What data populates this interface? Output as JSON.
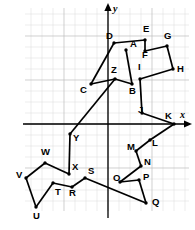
{
  "figure": {
    "background_color": "#ffffff",
    "stroke_color": "#000000",
    "grid_minor_color": "#d9d9d9",
    "grid_major_color": "#bcbcbc"
  },
  "axes": {
    "x_label": "x",
    "y_label": "y",
    "origin_px": {
      "x": 108,
      "y": 124
    },
    "cell_px": 11,
    "x_axis_y_px": 124,
    "y_axis_x_px": 108,
    "grid_left_px": 25,
    "grid_right_px": 189,
    "grid_top_px": 8,
    "grid_bottom_px": 211,
    "x_arrow": true,
    "y_arrow": true
  },
  "chart_data": {
    "type": "scatter",
    "xlabel": "x",
    "ylabel": "y",
    "grid": true,
    "legend": "none",
    "xlim": [
      -7.5,
      7.4
    ],
    "ylim": [
      -7.9,
      10.5
    ],
    "points": [
      {
        "label": "A",
        "px": [
          126,
          50
        ],
        "grid": [
          1.6,
          6.7
        ],
        "label_px": [
          130,
          47
        ]
      },
      {
        "label": "B",
        "px": [
          132,
          84
        ],
        "grid": [
          2.2,
          3.6
        ],
        "label_px": [
          129,
          94
        ]
      },
      {
        "label": "C",
        "px": [
          91,
          84
        ],
        "grid": [
          -1.5,
          3.6
        ],
        "label_px": [
          80,
          93
        ]
      },
      {
        "label": "D",
        "px": [
          114,
          43
        ],
        "grid": [
          0.5,
          7.4
        ],
        "label_px": [
          106,
          39
        ]
      },
      {
        "label": "E",
        "px": [
          145,
          40
        ],
        "grid": [
          3.4,
          7.6
        ],
        "label_px": [
          143,
          32
        ]
      },
      {
        "label": "F",
        "px": [
          145,
          51
        ],
        "grid": [
          3.4,
          6.6
        ],
        "label_px": [
          142,
          58
        ]
      },
      {
        "label": "G",
        "px": [
          167,
          46
        ],
        "grid": [
          5.4,
          7.1
        ],
        "label_px": [
          164,
          39
        ]
      },
      {
        "label": "H",
        "px": [
          173,
          69
        ],
        "grid": [
          5.9,
          5.0
        ],
        "label_px": [
          177,
          72
        ]
      },
      {
        "label": "I",
        "px": [
          140,
          79
        ],
        "grid": [
          2.9,
          4.1
        ],
        "label_px": [
          138,
          70
        ]
      },
      {
        "label": "J",
        "px": [
          142,
          113
        ],
        "grid": [
          3.1,
          1.0
        ],
        "label_px": [
          138,
          113
        ]
      },
      {
        "label": "K",
        "px": [
          174,
          124
        ],
        "grid": [
          6.0,
          0.0
        ],
        "label_px": [
          165,
          119
        ]
      },
      {
        "label": "L",
        "px": [
          150,
          140
        ],
        "grid": [
          3.8,
          -1.5
        ],
        "label_px": [
          152,
          146
        ]
      },
      {
        "label": "M",
        "px": [
          136,
          151
        ],
        "grid": [
          2.5,
          -2.5
        ],
        "label_px": [
          127,
          150
        ]
      },
      {
        "label": "N",
        "px": [
          141,
          166
        ],
        "grid": [
          3.0,
          -3.8
        ],
        "label_px": [
          144,
          165
        ]
      },
      {
        "label": "O",
        "px": [
          120,
          182
        ],
        "grid": [
          1.1,
          -5.3
        ],
        "label_px": [
          113,
          181
        ]
      },
      {
        "label": "P",
        "px": [
          139,
          180
        ],
        "grid": [
          2.8,
          -5.1
        ],
        "label_px": [
          143,
          180
        ]
      },
      {
        "label": "Q",
        "px": [
          146,
          203
        ],
        "grid": [
          3.5,
          -7.2
        ],
        "label_px": [
          152,
          205
        ]
      },
      {
        "label": "R",
        "px": [
          72,
          187
        ],
        "grid": [
          -3.3,
          -5.7
        ],
        "label_px": [
          69,
          196
        ]
      },
      {
        "label": "S",
        "px": [
          85,
          178
        ],
        "grid": [
          -2.1,
          -4.9
        ],
        "label_px": [
          88,
          174
        ]
      },
      {
        "label": "T",
        "px": [
          53,
          183
        ],
        "grid": [
          -5.0,
          -5.4
        ],
        "label_px": [
          55,
          195
        ]
      },
      {
        "label": "U",
        "px": [
          36,
          207
        ],
        "grid": [
          -6.5,
          -7.5
        ],
        "label_px": [
          33,
          219
        ]
      },
      {
        "label": "V",
        "px": [
          26,
          178
        ],
        "grid": [
          -7.5,
          -4.9
        ],
        "label_px": [
          16,
          178
        ]
      },
      {
        "label": "W",
        "px": [
          45,
          163
        ],
        "grid": [
          -5.7,
          -3.5
        ],
        "label_px": [
          41,
          155
        ]
      },
      {
        "label": "X",
        "px": [
          69,
          174
        ],
        "grid": [
          -3.5,
          -4.5
        ],
        "label_px": [
          72,
          170
        ]
      },
      {
        "label": "Y",
        "px": [
          70,
          134
        ],
        "grid": [
          -3.5,
          -0.9
        ],
        "label_px": [
          73,
          141
        ]
      },
      {
        "label": "Z",
        "px": [
          115,
          79
        ],
        "grid": [
          0.6,
          4.1
        ],
        "label_px": [
          111,
          73
        ]
      }
    ],
    "segments": [
      [
        "A",
        "B"
      ],
      [
        "B",
        "Z"
      ],
      [
        "Z",
        "C"
      ],
      [
        "C",
        "D"
      ],
      [
        "D",
        "E"
      ],
      [
        "E",
        "F"
      ],
      [
        "F",
        "G"
      ],
      [
        "G",
        "H"
      ],
      [
        "H",
        "I"
      ],
      [
        "I",
        "J"
      ],
      [
        "J",
        "K"
      ],
      [
        "K",
        "L"
      ],
      [
        "L",
        "M"
      ],
      [
        "M",
        "N"
      ],
      [
        "N",
        "O"
      ],
      [
        "O",
        "P"
      ],
      [
        "P",
        "Q"
      ],
      [
        "Q",
        "S"
      ],
      [
        "S",
        "R"
      ],
      [
        "R",
        "T"
      ],
      [
        "T",
        "U"
      ],
      [
        "U",
        "V"
      ],
      [
        "V",
        "W"
      ],
      [
        "W",
        "X"
      ],
      [
        "X",
        "Y"
      ],
      [
        "Y",
        "Z"
      ]
    ]
  }
}
